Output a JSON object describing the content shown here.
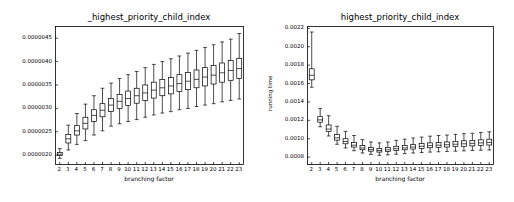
{
  "chart_data": [
    {
      "type": "box",
      "panel": "left",
      "title": "_highest_priority_child_index",
      "xlabel": "branching factor",
      "ylabel": "",
      "categories": [
        "2",
        "3",
        "4",
        "5",
        "6",
        "7",
        "8",
        "9",
        "10",
        "11",
        "12",
        "13",
        "14",
        "15",
        "16",
        "17",
        "18",
        "19",
        "20",
        "21",
        "22",
        "23"
      ],
      "ytick_labels": [
        "0.0000020",
        "0.0000025",
        "0.0000030",
        "0.0000035",
        "0.0000040",
        "0.0000045"
      ],
      "ytick_values": [
        2e-06,
        2.5e-06,
        3e-06,
        3.5e-06,
        4e-06,
        4.5e-06
      ],
      "ylim": [
        1.8e-06,
        4.75e-06
      ],
      "grid": false,
      "legend": false,
      "boxes": [
        {
          "x": "2",
          "whisker_low": 1.93e-06,
          "q1": 1.99e-06,
          "median": 2.02e-06,
          "q3": 2.06e-06,
          "whisker_high": 2.14e-06
        },
        {
          "x": "3",
          "whisker_low": 2.11e-06,
          "q1": 2.26e-06,
          "median": 2.35e-06,
          "q3": 2.44e-06,
          "whisker_high": 2.64e-06
        },
        {
          "x": "4",
          "whisker_low": 2.23e-06,
          "q1": 2.43e-06,
          "median": 2.52e-06,
          "q3": 2.63e-06,
          "whisker_high": 2.89e-06
        },
        {
          "x": "5",
          "whisker_low": 2.31e-06,
          "q1": 2.56e-06,
          "median": 2.68e-06,
          "q3": 2.81e-06,
          "whisker_high": 3.09e-06
        },
        {
          "x": "6",
          "whisker_low": 2.43e-06,
          "q1": 2.72e-06,
          "median": 2.85e-06,
          "q3": 2.97e-06,
          "whisker_high": 3.27e-06
        },
        {
          "x": "7",
          "whisker_low": 2.52e-06,
          "q1": 2.82e-06,
          "median": 2.96e-06,
          "q3": 3.1e-06,
          "whisker_high": 3.43e-06
        },
        {
          "x": "8",
          "whisker_low": 2.62e-06,
          "q1": 2.93e-06,
          "median": 3.07e-06,
          "q3": 3.21e-06,
          "whisker_high": 3.54e-06
        },
        {
          "x": "9",
          "whisker_low": 2.67e-06,
          "q1": 3e-06,
          "median": 3.15e-06,
          "q3": 3.3e-06,
          "whisker_high": 3.64e-06
        },
        {
          "x": "10",
          "whisker_low": 2.72e-06,
          "q1": 3.06e-06,
          "median": 3.21e-06,
          "q3": 3.37e-06,
          "whisker_high": 3.72e-06
        },
        {
          "x": "11",
          "whisker_low": 2.76e-06,
          "q1": 3.11e-06,
          "median": 3.27e-06,
          "q3": 3.43e-06,
          "whisker_high": 3.79e-06
        },
        {
          "x": "12",
          "whisker_low": 2.81e-06,
          "q1": 3.17e-06,
          "median": 3.33e-06,
          "q3": 3.5e-06,
          "whisker_high": 3.87e-06
        },
        {
          "x": "13",
          "whisker_low": 2.86e-06,
          "q1": 3.22e-06,
          "median": 3.39e-06,
          "q3": 3.56e-06,
          "whisker_high": 3.94e-06
        },
        {
          "x": "14",
          "whisker_low": 2.9e-06,
          "q1": 3.27e-06,
          "median": 3.44e-06,
          "q3": 3.62e-06,
          "whisker_high": 4e-06
        },
        {
          "x": "15",
          "whisker_low": 2.93e-06,
          "q1": 3.31e-06,
          "median": 3.48e-06,
          "q3": 3.66e-06,
          "whisker_high": 4.06e-06
        },
        {
          "x": "16",
          "whisker_low": 2.97e-06,
          "q1": 3.36e-06,
          "median": 3.53e-06,
          "q3": 3.72e-06,
          "whisker_high": 4.12e-06
        },
        {
          "x": "17",
          "whisker_low": 3e-06,
          "q1": 3.4e-06,
          "median": 3.58e-06,
          "q3": 3.77e-06,
          "whisker_high": 4.18e-06
        },
        {
          "x": "18",
          "whisker_low": 3.04e-06,
          "q1": 3.44e-06,
          "median": 3.62e-06,
          "q3": 3.82e-06,
          "whisker_high": 4.24e-06
        },
        {
          "x": "19",
          "whisker_low": 3.07e-06,
          "q1": 3.48e-06,
          "median": 3.67e-06,
          "q3": 3.87e-06,
          "whisker_high": 4.3e-06
        },
        {
          "x": "20",
          "whisker_low": 3.1e-06,
          "q1": 3.52e-06,
          "median": 3.71e-06,
          "q3": 3.92e-06,
          "whisker_high": 4.36e-06
        },
        {
          "x": "21",
          "whisker_low": 3.14e-06,
          "q1": 3.56e-06,
          "median": 3.76e-06,
          "q3": 3.97e-06,
          "whisker_high": 4.42e-06
        },
        {
          "x": "22",
          "whisker_low": 3.17e-06,
          "q1": 3.6e-06,
          "median": 3.81e-06,
          "q3": 4.02e-06,
          "whisker_high": 4.48e-06
        },
        {
          "x": "23",
          "whisker_low": 3.2e-06,
          "q1": 3.64e-06,
          "median": 3.85e-06,
          "q3": 4.07e-06,
          "whisker_high": 4.6e-06
        }
      ]
    },
    {
      "type": "box",
      "panel": "right",
      "title": "highest_priority_child_index",
      "xlabel": "branching factor",
      "ylabel": "running time",
      "categories": [
        "2",
        "3",
        "4",
        "5",
        "6",
        "7",
        "8",
        "9",
        "10",
        "11",
        "12",
        "13",
        "14",
        "15",
        "16",
        "17",
        "18",
        "19",
        "20",
        "21",
        "22",
        "23"
      ],
      "ytick_labels": [
        "0.0008",
        "0.0010",
        "0.0012",
        "0.0014",
        "0.0016",
        "0.0018",
        "0.0020",
        "0.0022"
      ],
      "ytick_values": [
        0.0008,
        0.001,
        0.0012,
        0.0014,
        0.0016,
        0.0018,
        0.002,
        0.0022
      ],
      "ylim": [
        0.00072,
        0.00222
      ],
      "grid": false,
      "legend": false,
      "boxes": [
        {
          "x": "2",
          "whisker_low": 0.00156,
          "q1": 0.00164,
          "median": 0.00169,
          "q3": 0.00176,
          "whisker_high": 0.00216
        },
        {
          "x": "3",
          "whisker_low": 0.00113,
          "q1": 0.00118,
          "median": 0.001205,
          "q3": 0.00124,
          "whisker_high": 0.00133
        },
        {
          "x": "4",
          "whisker_low": 0.00103,
          "q1": 0.00108,
          "median": 0.001105,
          "q3": 0.00115,
          "whisker_high": 0.00125
        },
        {
          "x": "5",
          "whisker_low": 0.00094,
          "q1": 0.000985,
          "median": 0.00101,
          "q3": 0.001045,
          "whisker_high": 0.001135
        },
        {
          "x": "6",
          "whisker_low": 0.0009,
          "q1": 0.000945,
          "median": 0.00097,
          "q3": 0.001,
          "whisker_high": 0.00108
        },
        {
          "x": "7",
          "whisker_low": 0.00087,
          "q1": 0.00091,
          "median": 0.00093,
          "q3": 0.00096,
          "whisker_high": 0.001035
        },
        {
          "x": "8",
          "whisker_low": 0.000845,
          "q1": 0.00088,
          "median": 0.0009,
          "q3": 0.000925,
          "whisker_high": 0.00099
        },
        {
          "x": "9",
          "whisker_low": 0.00083,
          "q1": 0.000865,
          "median": 0.000882,
          "q3": 0.000905,
          "whisker_high": 0.000965
        },
        {
          "x": "10",
          "whisker_low": 0.00082,
          "q1": 0.000855,
          "median": 0.000872,
          "q3": 0.000895,
          "whisker_high": 0.000955
        },
        {
          "x": "11",
          "whisker_low": 0.000825,
          "q1": 0.000862,
          "median": 0.00088,
          "q3": 0.000905,
          "whisker_high": 0.000965
        },
        {
          "x": "12",
          "whisker_low": 0.000832,
          "q1": 0.000872,
          "median": 0.000892,
          "q3": 0.000918,
          "whisker_high": 0.000982
        },
        {
          "x": "13",
          "whisker_low": 0.000838,
          "q1": 0.00088,
          "median": 0.0009,
          "q3": 0.000928,
          "whisker_high": 0.000995
        },
        {
          "x": "14",
          "whisker_low": 0.000845,
          "q1": 0.000888,
          "median": 0.00091,
          "q3": 0.000938,
          "whisker_high": 0.001008
        },
        {
          "x": "15",
          "whisker_low": 0.00085,
          "q1": 0.000895,
          "median": 0.000918,
          "q3": 0.000948,
          "whisker_high": 0.001018
        },
        {
          "x": "16",
          "whisker_low": 0.000855,
          "q1": 0.000902,
          "median": 0.000925,
          "q3": 0.000955,
          "whisker_high": 0.001028
        },
        {
          "x": "17",
          "whisker_low": 0.000858,
          "q1": 0.000905,
          "median": 0.00093,
          "q3": 0.00096,
          "whisker_high": 0.001035
        },
        {
          "x": "18",
          "whisker_low": 0.000862,
          "q1": 0.00091,
          "median": 0.000935,
          "q3": 0.000965,
          "whisker_high": 0.00104
        },
        {
          "x": "19",
          "whisker_low": 0.000865,
          "q1": 0.000915,
          "median": 0.00094,
          "q3": 0.000972,
          "whisker_high": 0.001048
        },
        {
          "x": "20",
          "whisker_low": 0.000868,
          "q1": 0.000918,
          "median": 0.000945,
          "q3": 0.000978,
          "whisker_high": 0.001055
        },
        {
          "x": "21",
          "whisker_low": 0.000872,
          "q1": 0.000922,
          "median": 0.00095,
          "q3": 0.000982,
          "whisker_high": 0.00106
        },
        {
          "x": "22",
          "whisker_low": 0.000875,
          "q1": 0.000928,
          "median": 0.000955,
          "q3": 0.000988,
          "whisker_high": 0.001068
        },
        {
          "x": "23",
          "whisker_low": 0.000878,
          "q1": 0.000932,
          "median": 0.00096,
          "q3": 0.000995,
          "whisker_high": 0.001075
        }
      ]
    }
  ]
}
